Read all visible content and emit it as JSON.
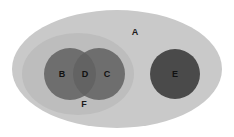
{
  "diagram": {
    "type": "venn-euler",
    "title": "",
    "canvas": {
      "width": 234,
      "height": 137,
      "background": "#ffffff"
    },
    "palette": {
      "universe_fill": "#c9c9c9",
      "subset_fill": "#bdbdbd",
      "circle_fill": "#6e6e6e",
      "intersection_fill": "#636363",
      "isolated_fill": "#4a4a4a",
      "label_color": "#1b1b1b"
    },
    "regions": [
      {
        "id": "A",
        "label": "A",
        "shape": "ellipse",
        "role": "universe",
        "cx": 117,
        "cy": 69,
        "rx": 105,
        "ry": 59,
        "fill": "#c9c9c9",
        "label_x": 135,
        "label_y": 32
      },
      {
        "id": "F",
        "label": "F",
        "shape": "ellipse",
        "role": "subset",
        "cx": 78,
        "cy": 74,
        "rx": 56,
        "ry": 41,
        "fill": "#bdbdbd",
        "label_x": 84,
        "label_y": 104
      },
      {
        "id": "B",
        "label": "B",
        "shape": "circle",
        "role": "set",
        "cx": 70,
        "cy": 74,
        "r": 26,
        "fill": "#6e6e6e",
        "label_x": 62,
        "label_y": 74
      },
      {
        "id": "C",
        "label": "C",
        "shape": "circle",
        "role": "set",
        "cx": 99,
        "cy": 74,
        "r": 26,
        "fill": "#6e6e6e",
        "label_x": 107,
        "label_y": 74
      },
      {
        "id": "D",
        "label": "D",
        "shape": "lens",
        "role": "intersection",
        "of": [
          "B",
          "C"
        ],
        "fill": "#636363",
        "label_x": 85,
        "label_y": 74
      },
      {
        "id": "E",
        "label": "E",
        "shape": "circle",
        "role": "set",
        "cx": 175,
        "cy": 74,
        "r": 25,
        "fill": "#4a4a4a",
        "label_x": 175,
        "label_y": 74
      }
    ]
  }
}
